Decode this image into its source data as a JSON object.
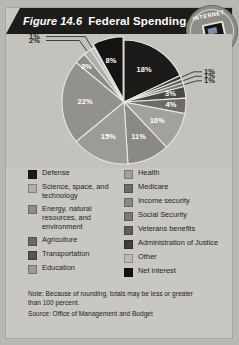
{
  "figure": {
    "number": "Figure 14.6",
    "title": "Federal Spending, 2003"
  },
  "badge": {
    "top_text": "INTERNET",
    "bottom_text": "UPDATE",
    "icon": "computer-monitor-icon"
  },
  "note": {
    "line1": "Note:  Because of rounding, totals may be less or greater",
    "line2": "than 100 percent.",
    "source": "Source: Office of Management and Budget"
  },
  "colors": {
    "title_bar": "#1e1c1a",
    "figure_bg": "#c9c7c2",
    "chart_bg": "#c4c2bd",
    "page_bg": "#b9b7b2"
  },
  "legend": {
    "left": [
      {
        "label": "Defense",
        "color": "#1c1b19"
      },
      {
        "label": "Science, space, and technology",
        "color": "#b0aea9"
      },
      {
        "label": "Energy, natural resources, and environment",
        "color": "#8d8b86"
      },
      {
        "label": "Agriculture",
        "color": "#6b6965"
      },
      {
        "label": "Transportation",
        "color": "#575551"
      },
      {
        "label": "Education",
        "color": "#9d9b96"
      }
    ],
    "right": [
      {
        "label": "Health",
        "color": "#a3a19c"
      },
      {
        "label": "Medicare",
        "color": "#6e6c68"
      },
      {
        "label": "Income security",
        "color": "#8a8883"
      },
      {
        "label": "Social Security",
        "color": "#7b7975"
      },
      {
        "label": "Veterans benefits",
        "color": "#605e5a"
      },
      {
        "label": "Administration of Justice",
        "color": "#3f3e3b"
      },
      {
        "label": "Other",
        "color": "#bdbbb6"
      },
      {
        "label": "Net interest",
        "color": "#141312"
      }
    ]
  },
  "chart_data": {
    "type": "pie",
    "title": "Federal Spending, 2003",
    "unit": "percent",
    "legend_position": "below",
    "grid": false,
    "total_note": "Because of rounding, totals may be less or greater than 100 percent.",
    "categories": [
      "Defense",
      "Net interest",
      "Administration of Justice",
      "Veterans benefits",
      "Social Security",
      "Income security",
      "Medicare",
      "Health",
      "Education",
      "Transportation",
      "Agriculture",
      "Energy, natural resources, and environment",
      "Science, space, and technology",
      "Other"
    ],
    "values": [
      18,
      8,
      1,
      1,
      1,
      3,
      4,
      10,
      11,
      15,
      22,
      3,
      2,
      1
    ],
    "slices": [
      {
        "label": "18%",
        "value": 18,
        "category": "Defense",
        "color": "#1c1b19"
      },
      {
        "label": "1%",
        "value": 1,
        "category": "Administration of Justice",
        "color": "#3f3e3b"
      },
      {
        "label": "1%",
        "value": 1,
        "category": "Veterans benefits",
        "color": "#605e5a"
      },
      {
        "label": "1%",
        "value": 1,
        "category": "Social Security",
        "color": "#7b7975"
      },
      {
        "label": "3%",
        "value": 3,
        "category": "Income security",
        "color": "#4a4946"
      },
      {
        "label": "4%",
        "value": 4,
        "category": "Medicare",
        "color": "#6e6c68"
      },
      {
        "label": "10%",
        "value": 10,
        "category": "Health",
        "color": "#a3a19c"
      },
      {
        "label": "11%",
        "value": 11,
        "category": "Education",
        "color": "#8b8984"
      },
      {
        "label": "15%",
        "value": 15,
        "category": "Transportation",
        "color": "#9d9b96"
      },
      {
        "label": "22%",
        "value": 22,
        "category": "Agriculture",
        "color": "#93918c"
      },
      {
        "label": "3%",
        "value": 3,
        "category": "Energy, natural resources, and environment",
        "color": "#8d8b86"
      },
      {
        "label": "2%",
        "value": 2,
        "category": "Science, space, and technology",
        "color": "#b0aea9"
      },
      {
        "label": "1%",
        "value": 1,
        "category": "Other",
        "color": "#bdbbb6"
      },
      {
        "label": "8%",
        "value": 8,
        "category": "Net interest",
        "color": "#141312"
      }
    ]
  }
}
